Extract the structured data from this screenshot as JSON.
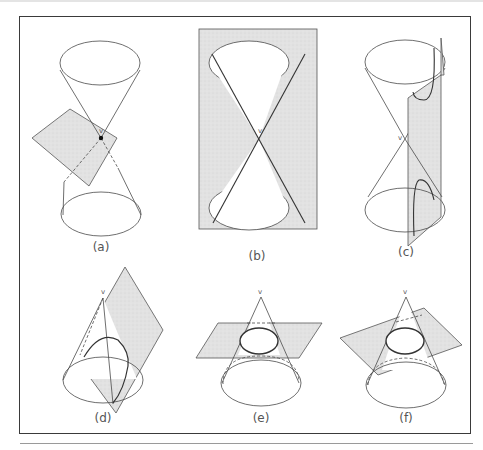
{
  "figure": {
    "panels": [
      {
        "id": "a",
        "caption": "(a)",
        "vertex_label": "v",
        "description": "Plane through vertex: point"
      },
      {
        "id": "b",
        "caption": "(b)",
        "vertex_label": "v",
        "description": "Plane through axis: two intersecting lines"
      },
      {
        "id": "c",
        "caption": "(c)",
        "vertex_label": "v",
        "description": "Plane parallel to axis: hyperbola"
      },
      {
        "id": "d",
        "caption": "(d)",
        "vertex_label": "v",
        "description": "Plane parallel to generator: parabola"
      },
      {
        "id": "e",
        "caption": "(e)",
        "vertex_label": "v",
        "description": "Plane perpendicular to axis: circle"
      },
      {
        "id": "f",
        "caption": "(f)",
        "vertex_label": "v",
        "description": "Tilted plane: ellipse"
      }
    ],
    "colors": {
      "plane_fill": "#e3e3e3",
      "line": "#444444",
      "frame": "#3a3a3a"
    }
  }
}
